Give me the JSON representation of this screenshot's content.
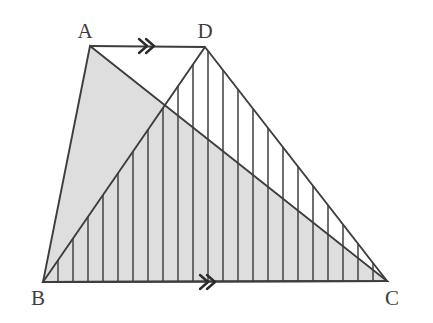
{
  "figure": {
    "type": "geometry-diagram",
    "canvas": {
      "width": 433,
      "height": 323,
      "background": "#ffffff"
    },
    "colors": {
      "stroke": "#3d3d3d",
      "shade_fill": "#dedede",
      "hatch_stroke": "#555555",
      "label_color": "#3d3d3d",
      "background": "#ffffff"
    },
    "vertices": [
      {
        "name": "A",
        "label": "A",
        "x": 90,
        "y": 46,
        "label_x": 85,
        "label_y": 38
      },
      {
        "name": "D",
        "label": "D",
        "x": 205,
        "y": 47,
        "label_x": 205,
        "label_y": 38
      },
      {
        "name": "B",
        "label": "B",
        "x": 43,
        "y": 282,
        "label_x": 38,
        "label_y": 305
      },
      {
        "name": "C",
        "label": "C",
        "x": 387,
        "y": 281,
        "label_x": 392,
        "label_y": 305
      }
    ],
    "segments": [
      {
        "name": "AD",
        "from": "A",
        "to": "D",
        "marker": "double-chevron"
      },
      {
        "name": "BC",
        "from": "B",
        "to": "C",
        "marker": "double-chevron"
      },
      {
        "name": "AB",
        "from": "A",
        "to": "B",
        "marker": "none"
      },
      {
        "name": "AC",
        "from": "A",
        "to": "C",
        "marker": "none"
      },
      {
        "name": "DB",
        "from": "D",
        "to": "B",
        "marker": "none"
      },
      {
        "name": "DC",
        "from": "D",
        "to": "C",
        "marker": "none"
      }
    ],
    "regions": [
      {
        "name": "triangle-abc-shaded",
        "vertices": [
          "A",
          "B",
          "C"
        ],
        "fill": "#dedede",
        "style": "solid-gray-shading"
      },
      {
        "name": "triangle-dbc-hatched",
        "vertices": [
          "D",
          "B",
          "C"
        ],
        "fill": "none",
        "style": "vertical-line-hatching",
        "hatch_spacing": 15,
        "hatch_count": 23
      }
    ],
    "markers": [
      {
        "name": "parallel-marker-ad",
        "glyph": "double-chevron",
        "on_segment": "AD",
        "x": 147,
        "y": 46
      },
      {
        "name": "parallel-marker-bc",
        "glyph": "double-chevron",
        "on_segment": "BC",
        "x": 208,
        "y": 282
      }
    ],
    "intersection": {
      "name": "AC-DB-intersection",
      "x": 163,
      "y": 106
    }
  }
}
